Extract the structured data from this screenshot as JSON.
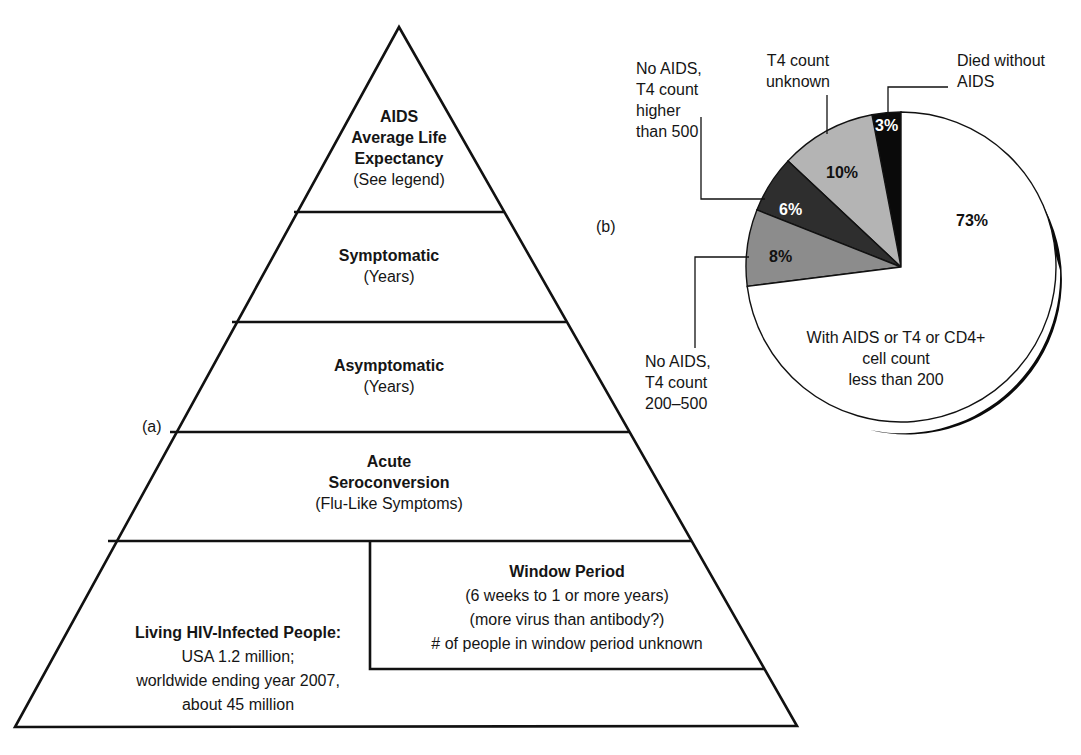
{
  "panel_a": {
    "label": "(a)",
    "levels": [
      {
        "title_lines": [
          "AIDS",
          "Average Life",
          "Expectancy"
        ],
        "subtitle": "(See legend)"
      },
      {
        "title_lines": [
          "Symptomatic"
        ],
        "subtitle": "(Years)"
      },
      {
        "title_lines": [
          "Asymptomatic"
        ],
        "subtitle": "(Years)"
      },
      {
        "title_lines": [
          "Acute",
          "Seroconversion"
        ],
        "subtitle": "(Flu-Like Symptoms)"
      }
    ],
    "base_left": {
      "title": "Living HIV-Infected People:",
      "lines": [
        "USA 1.2 million;",
        "worldwide ending year 2007,",
        "about 45 million"
      ]
    },
    "window_period": {
      "title": "Window Period",
      "lines": [
        "(6 weeks to 1 or more years)",
        "(more virus than antibody?)",
        "# of people in window period unknown"
      ]
    }
  },
  "panel_b": {
    "label": "(b)"
  },
  "chart_data": {
    "type": "pie",
    "title": "",
    "start_angle": "12 o'clock, counterclockwise",
    "slices": [
      {
        "label": "Died without AIDS",
        "value": 3,
        "pct_label": "3%",
        "color": "#0a0a0a"
      },
      {
        "label": "T4 count unknown",
        "value": 10,
        "pct_label": "10%",
        "color": "#b4b4b4"
      },
      {
        "label": "No AIDS, T4 count higher than 500",
        "value": 6,
        "pct_label": "6%",
        "color": "#2e2e2e"
      },
      {
        "label": "No AIDS, T4 count 200–500",
        "value": 8,
        "pct_label": "8%",
        "color": "#8c8c8c"
      },
      {
        "label": "With AIDS or T4 or CD4+ cell count less than 200",
        "value": 73,
        "pct_label": "73%",
        "color": "#ffffff"
      }
    ],
    "callouts": {
      "died": [
        "Died without",
        "AIDS"
      ],
      "unknown": [
        "T4 count",
        "unknown"
      ],
      "higher500": [
        "No AIDS,",
        "T4 count",
        "higher",
        "than 500"
      ],
      "range200_500": [
        "No AIDS,",
        "T4 count",
        "200–500"
      ],
      "less200": [
        "With AIDS or T4 or CD4+",
        "cell count",
        "less than 200"
      ]
    }
  }
}
